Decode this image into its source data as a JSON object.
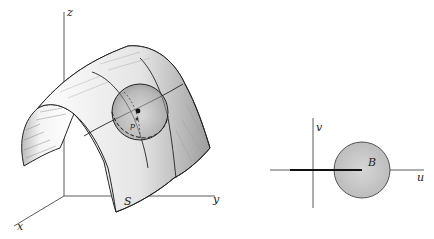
{
  "figure": {
    "left_panel": {
      "axes": {
        "z": "z",
        "x": "x",
        "y": "y"
      },
      "surface_label": "S",
      "point_label": "p"
    },
    "right_panel": {
      "axes": {
        "u": "u",
        "v": "v"
      },
      "disk_label": "B"
    },
    "colors": {
      "ink": "#222222",
      "shade": "#9a9a9a",
      "disk_fill": "#c8c8c8"
    }
  }
}
